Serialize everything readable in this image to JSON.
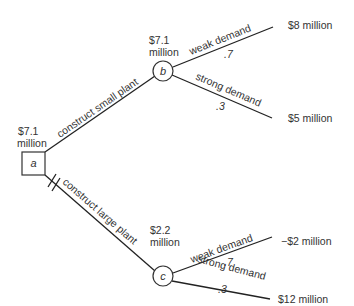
{
  "diagram": {
    "type": "decision-tree",
    "nodes": {
      "a": {
        "label": "a",
        "shape": "square",
        "value_line1": "$7.1",
        "value_line2": "million"
      },
      "b": {
        "label": "b",
        "shape": "circle",
        "value_line1": "$7.1",
        "value_line2": "million"
      },
      "c": {
        "label": "c",
        "shape": "circle",
        "value_line1": "$2.2",
        "value_line2": "million"
      }
    },
    "edges": {
      "a_b": {
        "label": "construct small plant"
      },
      "a_c": {
        "label": "construct large plant",
        "pruned": true
      },
      "b_weak": {
        "label": "weak demand",
        "probability": ".7",
        "payoff": "$8 million"
      },
      "b_strong": {
        "label": "strong demand",
        "probability": ".3",
        "payoff": "$5 million"
      },
      "c_weak": {
        "label": "weak demand",
        "probability": ".7",
        "payoff": "−$2 million"
      },
      "c_strong": {
        "label": "strong demand",
        "probability": ".3",
        "payoff": "$12 million"
      }
    }
  }
}
